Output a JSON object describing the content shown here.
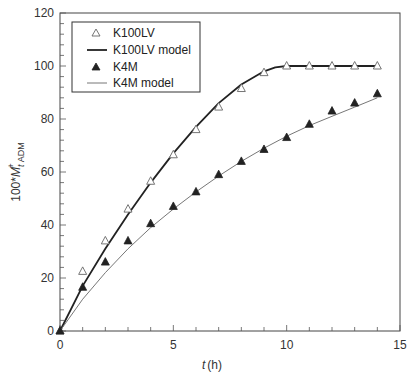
{
  "chart_data": {
    "type": "line",
    "title": "",
    "xlabel": "t (h)",
    "xlabel_italic": "t",
    "xlabel_unit": "(h)",
    "ylabel": "100*M_t^+ ADM",
    "ylabel_parts": {
      "prefix": "100*",
      "var": "M",
      "sub": "t",
      "sup": "+",
      "subscript2": "ADM"
    },
    "xlim": [
      0,
      15
    ],
    "ylim": [
      0,
      120
    ],
    "xticks": [
      0,
      5,
      10,
      15
    ],
    "yticks": [
      0,
      20,
      40,
      60,
      80,
      100,
      120
    ],
    "x_minor_step": 1,
    "y_minor_step": 4,
    "grid": false,
    "legend_position": "upper left",
    "series": [
      {
        "name": "K100LV",
        "kind": "markers",
        "marker": "open-triangle",
        "color": "#555555",
        "x": [
          0,
          1,
          2,
          3,
          4,
          5,
          6,
          7,
          8,
          9,
          10,
          11,
          12,
          13,
          14
        ],
        "y": [
          0,
          22.5,
          34,
          46,
          56.5,
          66.5,
          76,
          84.5,
          91.5,
          97.5,
          100,
          100,
          100,
          100,
          100
        ]
      },
      {
        "name": "K100LV model",
        "kind": "line",
        "color": "#222222",
        "width": 1.8,
        "x": [
          0,
          1,
          2,
          3,
          4,
          5,
          6,
          7,
          8,
          9,
          9.5,
          10,
          10.5,
          11,
          12,
          13,
          14
        ],
        "y": [
          0,
          17,
          31,
          44,
          56,
          67,
          77,
          86,
          93,
          98,
          99.5,
          100,
          100,
          100,
          100,
          100,
          100
        ]
      },
      {
        "name": "K4M",
        "kind": "markers",
        "marker": "filled-triangle",
        "color": "#222222",
        "x": [
          0,
          1,
          2,
          3,
          4,
          5,
          6,
          7,
          8,
          9,
          10,
          11,
          12,
          13,
          14
        ],
        "y": [
          0,
          16.5,
          26,
          34,
          40.5,
          47,
          52.5,
          59,
          64,
          68.5,
          73,
          78,
          83,
          86,
          89.5
        ]
      },
      {
        "name": "K4M model",
        "kind": "line",
        "color": "#777777",
        "width": 1,
        "x": [
          0,
          1,
          2,
          3,
          4,
          5,
          6,
          7,
          8,
          9,
          10,
          11,
          12,
          13,
          14
        ],
        "y": [
          0,
          12,
          22,
          31,
          39,
          46,
          52.5,
          58.5,
          64,
          69,
          73.5,
          77.5,
          81,
          84.5,
          88
        ]
      }
    ]
  },
  "legend": {
    "items": [
      {
        "label": "K100LV",
        "symbol": "open-triangle"
      },
      {
        "label": "K100LV model",
        "symbol": "thick-line"
      },
      {
        "label": "K4M",
        "symbol": "filled-triangle"
      },
      {
        "label": "K4M model",
        "symbol": "thin-line"
      }
    ]
  },
  "axes": {
    "x_tick_labels": [
      "0",
      "5",
      "10",
      "15"
    ],
    "y_tick_labels": [
      "0",
      "20",
      "40",
      "60",
      "80",
      "100",
      "120"
    ]
  }
}
